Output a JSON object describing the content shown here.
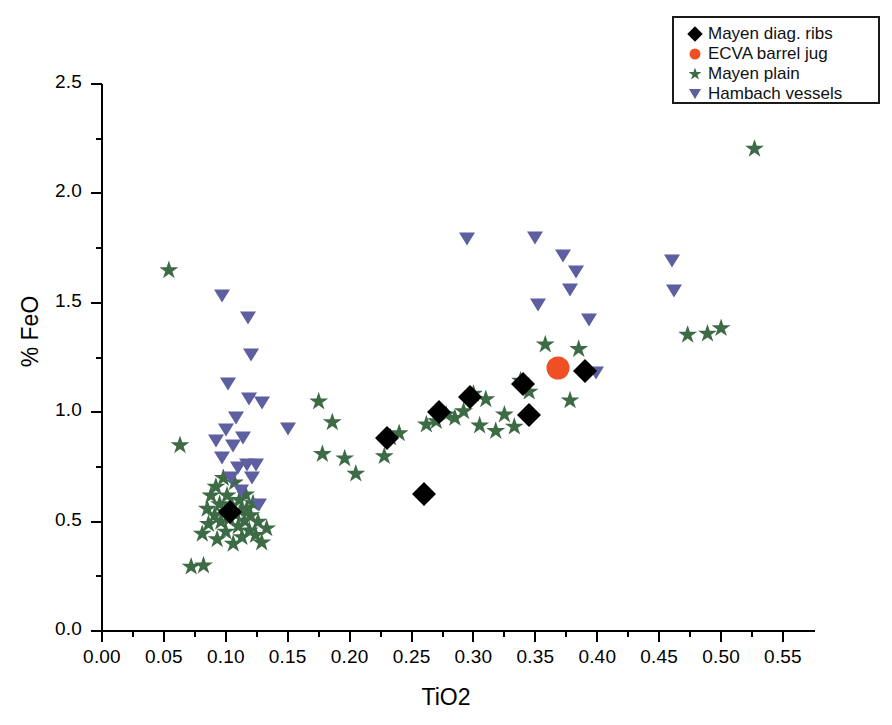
{
  "chart_data": {
    "type": "scatter",
    "title": "",
    "xlabel": "TiO2",
    "ylabel": "% FeO",
    "xlim": [
      0.0,
      0.575
    ],
    "ylim": [
      0.0,
      2.5
    ],
    "xticks": [
      0.0,
      0.05,
      0.1,
      0.15,
      0.2,
      0.25,
      0.3,
      0.35,
      0.4,
      0.45,
      0.5,
      0.55
    ],
    "xtick_labels": [
      "0.00",
      "0.05",
      "0.10",
      "0.15",
      "0.20",
      "0.25",
      "0.30",
      "0.35",
      "0.40",
      "0.45",
      "0.50",
      "0.55"
    ],
    "yticks": [
      0.0,
      0.5,
      1.0,
      1.5,
      2.0,
      2.5
    ],
    "ytick_labels": [
      "0.0",
      "0.5",
      "1.0",
      "1.5",
      "2.0",
      "2.5"
    ],
    "x_minor_step": 0.025,
    "y_minor_step": 0.25,
    "grid": false,
    "legend_position": "top-right",
    "series": [
      {
        "name": "Mayen diag. ribs",
        "marker": "diamond",
        "color": "#000000",
        "points": [
          [
            0.103,
            0.545
          ],
          [
            0.23,
            0.88
          ],
          [
            0.26,
            0.625
          ],
          [
            0.272,
            1.0
          ],
          [
            0.297,
            1.07
          ],
          [
            0.34,
            1.13
          ],
          [
            0.345,
            0.985
          ],
          [
            0.39,
            1.19
          ]
        ]
      },
      {
        "name": "ECVA barrel jug",
        "marker": "circle",
        "color": "#f04e23",
        "points": [
          [
            0.368,
            1.2
          ]
        ]
      },
      {
        "name": "Mayen plain",
        "marker": "star",
        "color": "#3d6b45",
        "points": [
          [
            0.054,
            1.65
          ],
          [
            0.063,
            0.85
          ],
          [
            0.072,
            0.295
          ],
          [
            0.082,
            0.3
          ],
          [
            0.081,
            0.445
          ],
          [
            0.086,
            0.49
          ],
          [
            0.085,
            0.56
          ],
          [
            0.088,
            0.62
          ],
          [
            0.091,
            0.53
          ],
          [
            0.092,
            0.66
          ],
          [
            0.093,
            0.42
          ],
          [
            0.095,
            0.58
          ],
          [
            0.096,
            0.5
          ],
          [
            0.098,
            0.7
          ],
          [
            0.099,
            0.545
          ],
          [
            0.1,
            0.455
          ],
          [
            0.101,
            0.62
          ],
          [
            0.103,
            0.515
          ],
          [
            0.105,
            0.575
          ],
          [
            0.106,
            0.4
          ],
          [
            0.107,
            0.68
          ],
          [
            0.108,
            0.54
          ],
          [
            0.11,
            0.48
          ],
          [
            0.111,
            0.6
          ],
          [
            0.112,
            0.55
          ],
          [
            0.113,
            0.43
          ],
          [
            0.115,
            0.505
          ],
          [
            0.116,
            0.625
          ],
          [
            0.117,
            0.56
          ],
          [
            0.119,
            0.46
          ],
          [
            0.12,
            0.53
          ],
          [
            0.122,
            0.585
          ],
          [
            0.124,
            0.44
          ],
          [
            0.126,
            0.5
          ],
          [
            0.129,
            0.405
          ],
          [
            0.133,
            0.47
          ],
          [
            0.175,
            1.05
          ],
          [
            0.178,
            0.81
          ],
          [
            0.186,
            0.955
          ],
          [
            0.196,
            0.79
          ],
          [
            0.205,
            0.72
          ],
          [
            0.228,
            0.8
          ],
          [
            0.233,
            0.885
          ],
          [
            0.24,
            0.905
          ],
          [
            0.262,
            0.945
          ],
          [
            0.27,
            0.96
          ],
          [
            0.278,
            0.99
          ],
          [
            0.285,
            0.975
          ],
          [
            0.292,
            1.005
          ],
          [
            0.3,
            1.085
          ],
          [
            0.305,
            0.94
          ],
          [
            0.31,
            1.06
          ],
          [
            0.318,
            0.915
          ],
          [
            0.325,
            0.99
          ],
          [
            0.333,
            0.935
          ],
          [
            0.338,
            1.145
          ],
          [
            0.345,
            1.095
          ],
          [
            0.358,
            1.31
          ],
          [
            0.378,
            1.055
          ],
          [
            0.385,
            1.29
          ],
          [
            0.473,
            1.355
          ],
          [
            0.489,
            1.36
          ],
          [
            0.5,
            1.385
          ],
          [
            0.527,
            2.205
          ]
        ]
      },
      {
        "name": "Hambach vessels",
        "marker": "triangle-down",
        "color": "#5d5fa0",
        "points": [
          [
            0.092,
            0.87
          ],
          [
            0.097,
            0.79
          ],
          [
            0.1,
            0.92
          ],
          [
            0.102,
            1.13
          ],
          [
            0.104,
            0.7
          ],
          [
            0.106,
            0.845
          ],
          [
            0.108,
            0.975
          ],
          [
            0.11,
            0.745
          ],
          [
            0.112,
            0.64
          ],
          [
            0.114,
            0.88
          ],
          [
            0.117,
            0.76
          ],
          [
            0.119,
            1.06
          ],
          [
            0.121,
            0.7
          ],
          [
            0.124,
            0.76
          ],
          [
            0.127,
            0.575
          ],
          [
            0.129,
            1.04
          ],
          [
            0.097,
            1.53
          ],
          [
            0.118,
            1.43
          ],
          [
            0.12,
            1.26
          ],
          [
            0.15,
            0.925
          ],
          [
            0.295,
            1.79
          ],
          [
            0.35,
            1.795
          ],
          [
            0.352,
            1.49
          ],
          [
            0.372,
            1.715
          ],
          [
            0.378,
            1.56
          ],
          [
            0.383,
            1.64
          ],
          [
            0.393,
            1.42
          ],
          [
            0.399,
            1.18
          ],
          [
            0.46,
            1.69
          ],
          [
            0.462,
            1.555
          ]
        ]
      }
    ]
  },
  "legend": {
    "items": [
      {
        "label": "Mayen diag. ribs",
        "marker": "diamond"
      },
      {
        "label": "ECVA barrel jug",
        "marker": "circle"
      },
      {
        "label": "Mayen plain",
        "marker": "star"
      },
      {
        "label": "Hambach vessels",
        "marker": "triangle-down"
      }
    ]
  },
  "colors": {
    "diamond": "#000000",
    "circle": "#f04e23",
    "star": "#3d6b45",
    "triangle": "#5d5fa0",
    "axis": "#000000",
    "background": "#ffffff"
  }
}
